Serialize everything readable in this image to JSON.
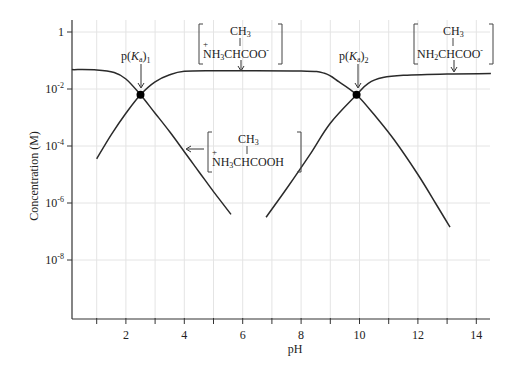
{
  "chart_data": {
    "type": "line",
    "title": "",
    "xlabel": "pH",
    "ylabel": "Concentration (M)",
    "xlim": [
      0,
      14.5
    ],
    "ylim_log10": [
      -10.2,
      0.5
    ],
    "y_scale": "log",
    "grid": true,
    "x_ticks": [
      1,
      2,
      3,
      4,
      5,
      6,
      7,
      8,
      9,
      10,
      11,
      12,
      13,
      14
    ],
    "x_tick_labels": [
      "2",
      "4",
      "6",
      "8",
      "10",
      "12",
      "14"
    ],
    "x_tick_label_values": [
      2,
      4,
      6,
      8,
      10,
      12,
      14
    ],
    "y_ticks_log10": [
      0,
      -2,
      -4,
      -6,
      -8
    ],
    "y_tick_labels": [
      {
        "base": "1",
        "exp": ""
      },
      {
        "base": "10",
        "exp": "-2"
      },
      {
        "base": "10",
        "exp": "-4"
      },
      {
        "base": "10",
        "exp": "-6"
      },
      {
        "base": "10",
        "exp": "-8"
      }
    ],
    "series": [
      {
        "name": "+NH3CH(CH3)COOH (cationic)",
        "points_pH_log10C": [
          [
            0.15,
            -1.32
          ],
          [
            1.0,
            -1.33
          ],
          [
            1.6,
            -1.42
          ],
          [
            2.0,
            -1.65
          ],
          [
            2.5,
            -2.2
          ],
          [
            3.0,
            -2.85
          ],
          [
            3.5,
            -3.5
          ],
          [
            4.0,
            -4.2
          ],
          [
            4.5,
            -4.9
          ],
          [
            5.0,
            -5.6
          ],
          [
            5.6,
            -6.4
          ]
        ]
      },
      {
        "name": "+NH3CH(CH3)COO- (zwitterion)",
        "points_pH_log10C": [
          [
            1.0,
            -4.45
          ],
          [
            1.5,
            -3.6
          ],
          [
            2.0,
            -2.85
          ],
          [
            2.5,
            -2.2
          ],
          [
            3.0,
            -1.75
          ],
          [
            3.5,
            -1.5
          ],
          [
            4.0,
            -1.38
          ],
          [
            5.0,
            -1.36
          ],
          [
            8.0,
            -1.37
          ],
          [
            8.8,
            -1.45
          ],
          [
            9.3,
            -1.75
          ],
          [
            9.9,
            -2.2
          ],
          [
            10.5,
            -2.9
          ],
          [
            11.2,
            -3.8
          ],
          [
            12.0,
            -5.0
          ],
          [
            12.6,
            -6.0
          ],
          [
            13.1,
            -6.85
          ]
        ]
      },
      {
        "name": "NH2CH(CH3)COO- (anionic)",
        "points_pH_log10C": [
          [
            6.8,
            -6.5
          ],
          [
            7.5,
            -5.5
          ],
          [
            8.3,
            -4.3
          ],
          [
            9.0,
            -3.2
          ],
          [
            9.9,
            -2.2
          ],
          [
            10.3,
            -1.8
          ],
          [
            10.8,
            -1.6
          ],
          [
            11.5,
            -1.52
          ],
          [
            13.0,
            -1.47
          ],
          [
            14.5,
            -1.46
          ]
        ]
      }
    ],
    "markers": [
      {
        "label": "p(Ka)1",
        "pH": 2.5,
        "log10C": -2.2
      },
      {
        "label": "p(Ka)2",
        "pH": 9.9,
        "log10C": -2.2
      }
    ],
    "annotations": [
      "p(Ka)1",
      "p(Ka)2",
      "CH3 / +NH3CHCOO- (zwitterion label)",
      "CH3 / +NH3CHCOOH (cation label)",
      "CH3 / NH2CHCOO- (anion label)"
    ],
    "legend": "none (inline structural labels)"
  },
  "labels": {
    "xlabel": "pH",
    "ylabel": "Concentration (M)",
    "pka1": {
      "p": "p(",
      "K": "K",
      "a": "a",
      ")": ")",
      "sub": "1"
    },
    "pka2": {
      "p": "p(",
      "K": "K",
      "a": "a",
      ")": ")",
      "sub": "2"
    },
    "zwitterion": {
      "top": "CH3",
      "plus": "+",
      "bottom": "NH3CHCOO",
      "charge": "-"
    },
    "cation": {
      "top": "CH3",
      "plus": "+",
      "bottom": "NH3CHCOOH"
    },
    "anion": {
      "top": "CH3",
      "bottom": "NH2CHCOO",
      "charge": "-"
    }
  }
}
